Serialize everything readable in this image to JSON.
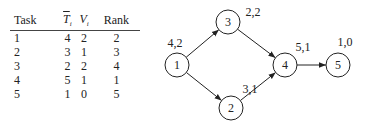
{
  "table": {
    "headers": [
      {
        "main": "Task",
        "sub": ""
      },
      {
        "main": "T",
        "sub": "i",
        "overline": true,
        "italic": true
      },
      {
        "main": "V",
        "sub": "i",
        "italic": true
      },
      {
        "main": "Rank",
        "sub": ""
      }
    ],
    "rows": [
      [
        "1",
        "4",
        "2",
        "2"
      ],
      [
        "2",
        "3",
        "1",
        "3"
      ],
      [
        "3",
        "2",
        "2",
        "4"
      ],
      [
        "4",
        "5",
        "1",
        "1"
      ],
      [
        "5",
        "1",
        "0",
        "5"
      ]
    ]
  },
  "graph": {
    "nodes": [
      {
        "id": "1",
        "label": "1",
        "x": 177,
        "y": 65,
        "annotation": "4,2",
        "ax": 175,
        "ay": 47
      },
      {
        "id": "2",
        "label": "2",
        "x": 231,
        "y": 108,
        "annotation": "3,1",
        "ax": 250,
        "ay": 93
      },
      {
        "id": "3",
        "label": "3",
        "x": 228,
        "y": 22,
        "annotation": "2,2",
        "ax": 253,
        "ay": 16
      },
      {
        "id": "4",
        "label": "4",
        "x": 285,
        "y": 65,
        "annotation": "5,1",
        "ax": 303,
        "ay": 51
      },
      {
        "id": "5",
        "label": "5",
        "x": 338,
        "y": 65,
        "annotation": "1,0",
        "ax": 345,
        "ay": 46
      }
    ],
    "edges": [
      {
        "from": "1",
        "to": "3"
      },
      {
        "from": "1",
        "to": "2"
      },
      {
        "from": "3",
        "to": "4"
      },
      {
        "from": "2",
        "to": "4"
      },
      {
        "from": "4",
        "to": "5"
      }
    ],
    "node_radius": 12
  }
}
